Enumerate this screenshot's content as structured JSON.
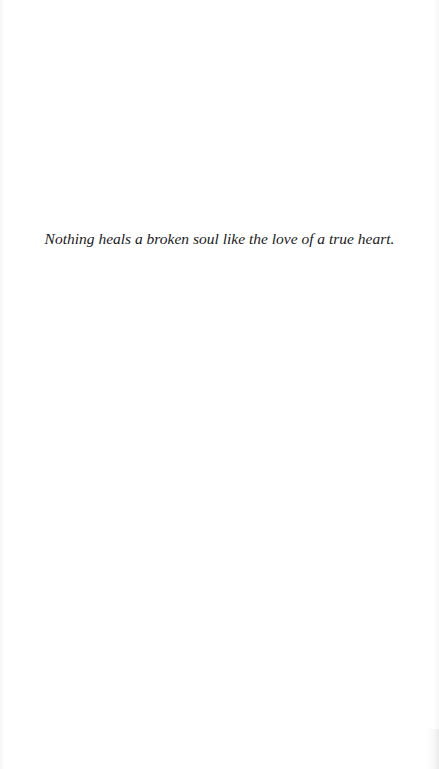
{
  "page": {
    "type": "epigraph",
    "background_color": "#ffffff",
    "text_color": "#1a1a1a",
    "epigraph": {
      "text": "Nothing heals a broken soul like the love of a true heart.",
      "style": "italic",
      "alignment": "center"
    }
  }
}
